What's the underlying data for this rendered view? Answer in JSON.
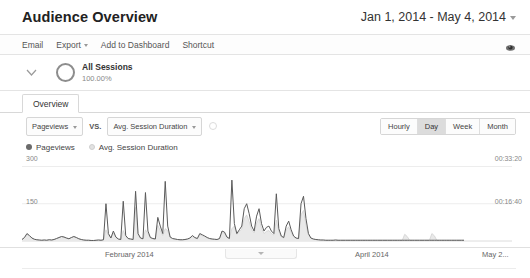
{
  "header": {
    "title": "Audience Overview",
    "date_range": "Jan 1, 2014 - May 4, 2014",
    "date_caret_icon": "chevron-down-icon"
  },
  "toolbar": {
    "items": [
      {
        "label": "Email",
        "has_caret": false
      },
      {
        "label": "Export",
        "has_caret": true
      },
      {
        "label": "Add to Dashboard",
        "has_caret": false
      },
      {
        "label": "Shortcut",
        "has_caret": false
      }
    ],
    "right_icon": "eye-annotations-icon"
  },
  "segment": {
    "expand_icon": "chevron-down-icon",
    "ring_icon": "segment-ring-icon",
    "name": "All Sessions",
    "percent": "100.00%"
  },
  "tabs": [
    {
      "label": "Overview",
      "active": true
    }
  ],
  "metric_controls": {
    "primary_metric": "Pageviews",
    "vs_label": "VS.",
    "secondary_metric": "Avg. Session Duration",
    "add_metric_icon": "add-circle-icon",
    "granularity": [
      {
        "label": "Hourly",
        "active": false
      },
      {
        "label": "Day",
        "active": true
      },
      {
        "label": "Week",
        "active": false
      },
      {
        "label": "Month",
        "active": false
      }
    ]
  },
  "legend": [
    {
      "label": "Pageviews",
      "style": "primary"
    },
    {
      "label": "Avg. Session Duration",
      "style": "secondary"
    }
  ],
  "colors": {
    "primary_line": "#5a5a5a",
    "secondary_fill": "#e8e8e8",
    "grid": "#ededed",
    "text": "#666666",
    "active_button": "#dcdcdc"
  },
  "chart_data": {
    "type": "line",
    "title": "Pageviews vs. Avg. Session Duration",
    "xlabel": "",
    "ylabel": "Pageviews",
    "y2label": "Avg. Session Duration",
    "grid": true,
    "legend_position": "top-left",
    "y_ticks_left": [
      "150",
      "300"
    ],
    "y_ticks_right": [
      "00:16:40",
      "00:33:20"
    ],
    "ylim": [
      0,
      330
    ],
    "y2lim_seconds": [
      0,
      2200
    ],
    "x_ticks": [
      "February 2014",
      "March 2014",
      "April 2014",
      "May 2..."
    ],
    "x_tick_positions_pct": [
      24.5,
      49.5,
      74.5,
      97.5
    ],
    "series": [
      {
        "name": "Pageviews",
        "unit": "pageviews",
        "values": [
          6,
          14,
          30,
          22,
          12,
          7,
          5,
          4,
          3,
          4,
          3,
          5,
          4,
          6,
          10,
          14,
          18,
          16,
          12,
          9,
          14,
          18,
          14,
          9,
          6,
          4,
          3,
          3,
          2,
          2,
          3,
          4,
          3,
          5,
          150,
          30,
          12,
          40,
          16,
          8,
          6,
          160,
          22,
          10,
          8,
          6,
          200,
          30,
          12,
          9,
          195,
          40,
          14,
          10,
          8,
          95,
          60,
          30,
          240,
          60,
          16,
          10,
          8,
          6,
          5,
          5,
          6,
          8,
          12,
          22,
          14,
          10,
          30,
          25,
          20,
          14,
          10,
          8,
          7,
          6,
          10,
          40,
          36,
          16,
          10,
          245,
          70,
          30,
          45,
          60,
          130,
          150,
          110,
          60,
          40,
          100,
          130,
          70,
          40,
          55,
          60,
          40,
          30,
          190,
          50,
          20,
          14,
          60,
          80,
          45,
          20,
          12,
          10,
          150,
          180,
          90,
          30,
          12,
          8,
          6,
          5,
          4,
          4,
          3,
          3,
          3,
          3,
          4,
          3,
          3,
          3,
          3,
          3,
          3,
          3,
          3,
          3,
          3,
          3,
          3,
          3,
          3,
          3,
          3,
          3,
          3,
          3,
          3,
          3,
          3,
          3,
          3,
          3,
          3,
          3,
          3,
          3,
          3,
          3,
          3,
          3,
          3,
          3,
          3,
          3,
          3,
          3,
          3,
          3,
          3,
          3,
          3,
          3,
          3,
          3,
          3,
          3,
          3,
          3,
          3
        ]
      },
      {
        "name": "Avg. Session Duration",
        "unit": "seconds",
        "values": [
          40,
          90,
          180,
          140,
          80,
          50,
          30,
          25,
          20,
          30,
          25,
          35,
          28,
          45,
          70,
          95,
          120,
          110,
          80,
          60,
          90,
          120,
          95,
          60,
          40,
          30,
          25,
          22,
          18,
          15,
          20,
          25,
          20,
          30,
          300,
          160,
          80,
          220,
          100,
          50,
          40,
          280,
          120,
          60,
          50,
          40,
          900,
          160,
          70,
          55,
          300,
          200,
          80,
          60,
          50,
          420,
          280,
          150,
          330,
          280,
          90,
          60,
          50,
          40,
          35,
          35,
          40,
          50,
          70,
          120,
          85,
          60,
          170,
          140,
          115,
          85,
          60,
          50,
          45,
          40,
          60,
          230,
          210,
          95,
          60,
          330,
          400,
          180,
          250,
          330,
          600,
          700,
          520,
          300,
          220,
          480,
          600,
          340,
          200,
          260,
          280,
          200,
          160,
          560,
          260,
          110,
          80,
          300,
          380,
          230,
          110,
          70,
          60,
          700,
          820,
          430,
          160,
          70,
          50,
          40,
          30,
          25,
          25,
          20,
          20,
          20,
          20,
          25,
          20,
          20,
          20,
          20,
          20,
          20,
          20,
          20,
          20,
          20,
          20,
          20,
          20,
          20,
          20,
          20,
          20,
          20,
          20,
          20,
          20,
          20,
          20,
          20,
          20,
          20,
          20,
          180,
          120,
          20,
          20,
          20,
          20,
          20,
          20,
          20,
          20,
          20,
          200,
          140,
          20,
          20,
          20,
          20,
          20,
          20,
          20,
          20,
          20,
          20,
          20,
          20
        ]
      }
    ]
  },
  "annotations_drawer": {
    "handle_icon": "chevron-down-icon"
  }
}
